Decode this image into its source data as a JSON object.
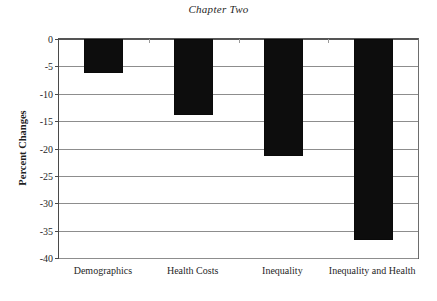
{
  "chart_data": {
    "type": "bar",
    "title": "Chapter Two",
    "xlabel": "",
    "ylabel": "Percent Changes",
    "categories": [
      "Demographics",
      "Health Costs",
      "Inequality",
      "Inequality and Health"
    ],
    "values": [
      -6.3,
      -13.8,
      -21.3,
      -36.7
    ],
    "ylim": [
      -40,
      0
    ],
    "ytick_labels": [
      "0",
      "-5",
      "-10",
      "-15",
      "-20",
      "-25",
      "-30",
      "-35",
      "-40"
    ],
    "ytick_values": [
      0,
      -5,
      -10,
      -15,
      -20,
      -25,
      -30,
      -35,
      -40
    ],
    "grid": true,
    "legend": "none",
    "bar_color": "#0d0d0d",
    "axis_color": "#4a4a4a",
    "grid_color": "#8d8d8d",
    "background": "#ffffff"
  }
}
